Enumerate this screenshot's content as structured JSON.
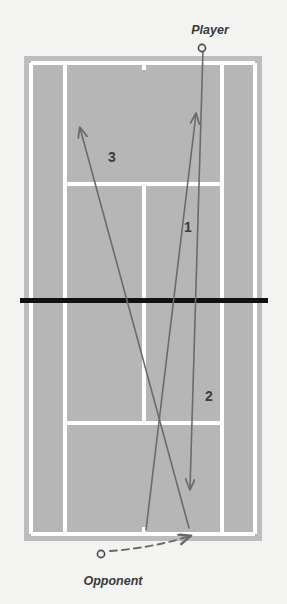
{
  "diagram": {
    "title_label": "Tennis court rally diagram",
    "colors": {
      "background": "#f3f3f1",
      "court_surround": "#bdbdbd",
      "court_surface": "#b8b8b8",
      "court_lines": "#ffffff",
      "net": "#111111",
      "shot_line": "#6b6b6b",
      "text": "#3a3a3a"
    },
    "players": [
      {
        "id": "player",
        "label": "Player",
        "marker": "open-circle",
        "x": 202,
        "y": 48,
        "label_x": 210,
        "label_y": 34
      },
      {
        "id": "opponent",
        "label": "Opponent",
        "marker": "open-circle",
        "x": 101,
        "y": 554,
        "label_x": 78,
        "label_y": 583
      }
    ],
    "shots": [
      {
        "number": "1",
        "from": "opponent",
        "to": "player-side",
        "style": "solid",
        "arrow": "up",
        "label_x": 188,
        "label_y": 232,
        "x1": 146,
        "y1": 530,
        "x2": 196,
        "y2": 114
      },
      {
        "number": "2",
        "from": "player",
        "to": "opponent-side",
        "style": "solid",
        "arrow": "down",
        "label_x": 209,
        "label_y": 401,
        "x1": 203,
        "y1": 50,
        "x2": 190,
        "y2": 489
      },
      {
        "number": "3",
        "from": "opponent",
        "to": "player-side",
        "style": "solid",
        "arrow": "up",
        "label_x": 112,
        "label_y": 162,
        "x1": 189,
        "y1": 528,
        "x2": 80,
        "y2": 128
      },
      {
        "number": "",
        "from": "opponent",
        "to": "recovery-position",
        "style": "dashed",
        "arrow": "right",
        "label_x": 0,
        "label_y": 0,
        "x1": 110,
        "y1": 551,
        "x2": 192,
        "y2": 535
      }
    ],
    "court": {
      "surround": {
        "x": 24,
        "y": 56,
        "width": 238,
        "height": 485
      },
      "outer_left_sideline": 31,
      "outer_right_sideline": 255,
      "singles_left_sideline": 65,
      "singles_right_sideline": 222,
      "center_service_line": 144,
      "top_baseline": 63,
      "bottom_baseline": 534,
      "top_service_line": 184,
      "bottom_service_line": 423,
      "net_y": 300,
      "net_x_start": 20,
      "net_x_end": 268,
      "line_width": 4,
      "net_width": 5
    }
  }
}
